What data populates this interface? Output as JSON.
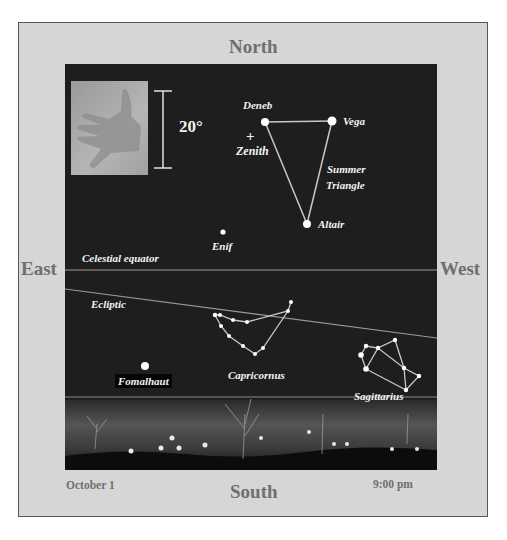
{
  "directions": {
    "north": "North",
    "south": "South",
    "east": "East",
    "west": "West"
  },
  "footer": {
    "date": "October 1",
    "time": "9:00 pm"
  },
  "scale": {
    "label": "20°",
    "icon": "hand-icon"
  },
  "stars": {
    "deneb": "Deneb",
    "vega": "Vega",
    "altair": "Altair",
    "enif": "Enif",
    "fomalhaut": "Fomalhaut"
  },
  "markers": {
    "zenith": "Zenith",
    "zenith_symbol": "+"
  },
  "lines": {
    "celestial_equator": "Celestial equator",
    "ecliptic": "Ecliptic"
  },
  "asterisms": {
    "summer_triangle_line1": "Summer",
    "summer_triangle_line2": "Triangle"
  },
  "constellations": {
    "capricornus": "Capricornus",
    "sagittarius": "Sagittarius"
  },
  "colors": {
    "frame": "#d6d6d6",
    "sky": "#1e1e1e",
    "label_gray": "#6f6f6f",
    "star": "#ffffff"
  }
}
